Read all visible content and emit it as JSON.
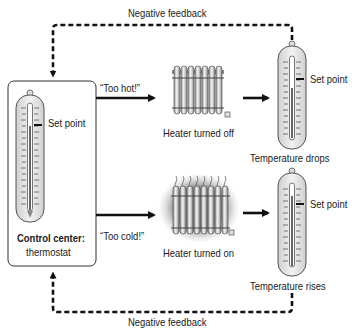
{
  "diagram": {
    "type": "negative-feedback-loop",
    "top_feedback_label": "Negative feedback",
    "bottom_feedback_label": "Negative feedback",
    "control_center": {
      "title": "Control center:",
      "subtitle": "thermostat",
      "thermometer_label": "Set point"
    },
    "branch_hot": {
      "signal": "“Too hot!”",
      "heater_label": "Heater turned off",
      "result_label": "Temperature drops",
      "thermometer_label": "Set point"
    },
    "branch_cold": {
      "signal": "“Too cold!”",
      "heater_label": "Heater turned on",
      "result_label": "Temperature rises",
      "thermometer_label": "Set point"
    },
    "colors": {
      "line": "#111111",
      "thermometer_fill": "#e6e6e6",
      "radiator_fill": "#d9d9d9",
      "glow": "#9a9a9a"
    }
  }
}
